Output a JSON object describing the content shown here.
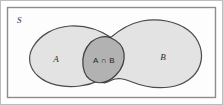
{
  "figure": {
    "type": "venn-diagram",
    "universe": {
      "label": "S",
      "border_color": "#8a8a8a",
      "fill_color": "#fdfdfd"
    },
    "sets": [
      {
        "id": "A",
        "label": "A",
        "fill_color": "#e3e3e3",
        "outline_color": "#4a4a4a"
      },
      {
        "id": "B",
        "label": "B",
        "fill_color": "#e3e3e3",
        "outline_color": "#4a4a4a"
      }
    ],
    "intersection": {
      "label": "A ∩ B",
      "fill_color": "#b2b2b2",
      "outline_color": "#3c3c3c"
    },
    "frame": {
      "outer_border_color": "#b9b9b9"
    }
  }
}
